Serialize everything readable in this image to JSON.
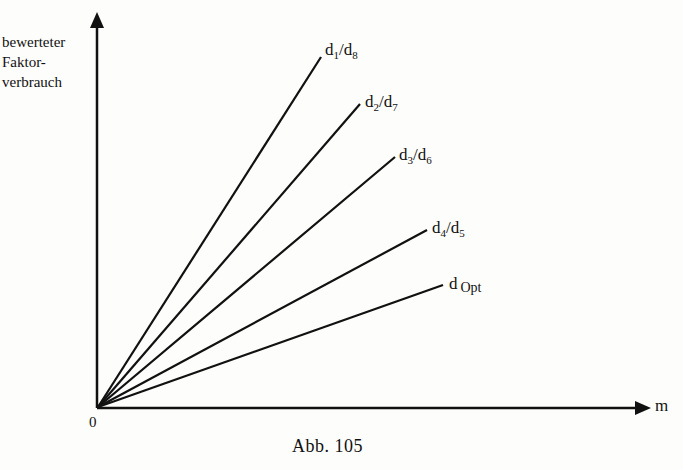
{
  "figure": {
    "caption": "Abb. 105",
    "y_axis_label": [
      "bewerteter",
      "Faktor-",
      "verbrauch"
    ],
    "x_axis_label": "m",
    "origin_label": "0"
  },
  "lines": [
    {
      "label_main": "d",
      "sub1": "1",
      "sep": "/d",
      "sub2": "8",
      "x2": 321,
      "y2": 57
    },
    {
      "label_main": "d",
      "sub1": "2",
      "sep": "/d",
      "sub2": "7",
      "x2": 360,
      "y2": 104
    },
    {
      "label_main": "d",
      "sub1": "3",
      "sep": "/d",
      "sub2": "6",
      "x2": 395,
      "y2": 157
    },
    {
      "label_main": "d",
      "sub1": "4",
      "sep": "/d",
      "sub2": "5",
      "x2": 427,
      "y2": 230
    },
    {
      "label_main": "d",
      "sub1": "Opt",
      "sep": "",
      "sub2": "",
      "x2": 443,
      "y2": 285
    }
  ],
  "colors": {
    "ink": "#111111",
    "background": "#fdfdfb"
  }
}
